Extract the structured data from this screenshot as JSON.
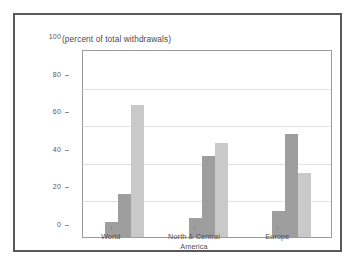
{
  "chart_data": {
    "type": "bar",
    "title": "(percent of total withdrawals)",
    "xlabel": "",
    "ylabel": "",
    "ylim": [
      0,
      100
    ],
    "yticks": [
      0,
      20,
      40,
      60,
      80,
      100
    ],
    "ytick_labels": [
      "0",
      "20",
      "40",
      "60",
      "80",
      "100"
    ],
    "grid": true,
    "legend_position": "top-center",
    "categories": [
      "World",
      "North & Central America",
      "Europe"
    ],
    "category_lines": [
      [
        "World"
      ],
      [
        "North & Central",
        "America"
      ],
      [
        "Europe"
      ]
    ],
    "series": [
      {
        "name": "Domestic",
        "values": [
          8,
          10,
          14
        ],
        "color": "#9e9e9e"
      },
      {
        "name": "Industry",
        "values": [
          23,
          43,
          55
        ],
        "color": "#9e9e9e"
      },
      {
        "name": "Agriculture",
        "values": [
          70,
          50,
          34
        ],
        "color": "#c9c9c9"
      }
    ]
  },
  "colors": {
    "frame": "#595959",
    "axis": "#9b9b9b",
    "grid": "#e3e3e3",
    "text": "#4f4f4f",
    "background": "#ffffff",
    "domestic": "#9e9e9e",
    "industry": "#9e9e9e",
    "agriculture": "#c9c9c9"
  }
}
